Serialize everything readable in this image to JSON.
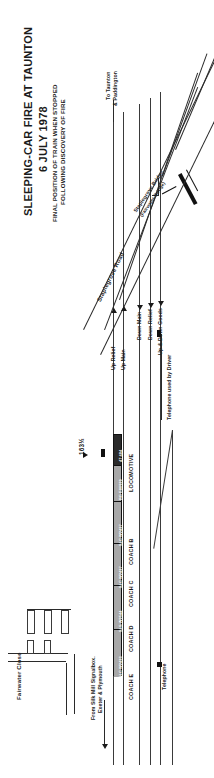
{
  "document": {
    "title_line1": "SLEEPING-CAR FIRE AT TAUNTON",
    "title_line2": "6 JULY 1978",
    "subtitle_line1": "FINAL POSITION OF TRAIN WHEN STOPPED",
    "subtitle_line2": "FOLLOWING DISCOVERY OF FIRE"
  },
  "map": {
    "direction_to": "To Taunton\n& Paddington",
    "direction_to_line1": "To Taunton",
    "direction_to_line2": "& Paddington",
    "direction_from_line1": "From Silk Mill Signalbox.",
    "direction_from_line2": "Exeter & Plymouth",
    "bridge_line1": "Staplegrove Bridge",
    "bridge_line2": "(Fairwater Bridge)",
    "road_staplegrove": "Staplegrove Road",
    "road_fairwater": "Fairwater Close",
    "milepost": "163½",
    "driver_phone_label": "Telephone used by Driver"
  },
  "tracks": [
    {
      "name": "Up Relief",
      "direction": "up"
    },
    {
      "name": "Up Main",
      "direction": "up"
    },
    {
      "name": "Down Main",
      "direction": "down"
    },
    {
      "name": "Down Relief",
      "direction": "down"
    },
    {
      "name": "Up & Down Goods",
      "direction": "down"
    }
  ],
  "train": {
    "vehicles": [
      {
        "number": "SLC W2433",
        "coach": "COACH E",
        "shade": "light"
      },
      {
        "number": "SLS W2544",
        "coach": "COACH D",
        "shade": "light"
      },
      {
        "number": "SLC W2437",
        "coach": "COACH C",
        "shade": "light"
      },
      {
        "number": "SLC W2437",
        "coach": "COACH B",
        "shade": "light"
      },
      {
        "number": "BG E80939",
        "coach": "",
        "shade": "light"
      },
      {
        "number": "47 484",
        "coach": "LOCOMOTIVE",
        "shade": "dark"
      }
    ]
  },
  "legend": {
    "telephone": "Telephone",
    "telephone_symbol": "filled-square"
  },
  "colors": {
    "ink": "#1b1b1b",
    "rail": "#3a3a3a",
    "coach_fill": "#a8a8a8",
    "loco_fill": "#2b2b2b",
    "paper": "#ffffff"
  }
}
